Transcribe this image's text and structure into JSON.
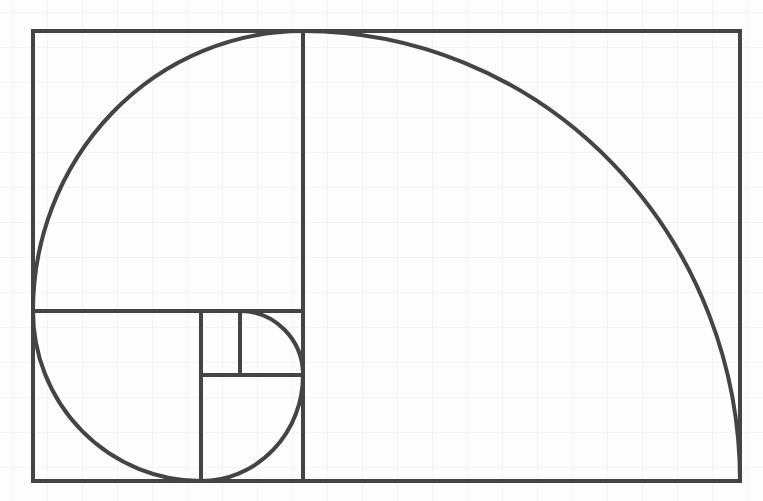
{
  "diagram": {
    "title": "",
    "type": "golden-spiral",
    "stroke_color": "#444444",
    "stroke_width": 4,
    "background_color": "#fdfdfd",
    "grid_spacing": 35,
    "outer_rect": {
      "x1": 33,
      "y1": 31,
      "x2": 740,
      "y2": 481
    },
    "squares": [
      {
        "name": "square-1",
        "x1": 33,
        "y1": 31,
        "x2": 303,
        "y2": 311
      },
      {
        "name": "square-2",
        "x1": 303,
        "y1": 31,
        "x2": 740,
        "y2": 481
      },
      {
        "name": "square-3",
        "x1": 33,
        "y1": 311,
        "x2": 201,
        "y2": 481
      },
      {
        "name": "square-4",
        "x1": 201,
        "y1": 375,
        "x2": 303,
        "y2": 481
      },
      {
        "name": "square-5",
        "x1": 240,
        "y1": 311,
        "x2": 303,
        "y2": 375
      },
      {
        "name": "square-6",
        "x1": 201,
        "y1": 311,
        "x2": 240,
        "y2": 375
      }
    ],
    "lines": [
      {
        "x1": 303,
        "y1": 31,
        "x2": 303,
        "y2": 481
      },
      {
        "x1": 33,
        "y1": 311,
        "x2": 303,
        "y2": 311
      },
      {
        "x1": 201,
        "y1": 311,
        "x2": 201,
        "y2": 481
      },
      {
        "x1": 201,
        "y1": 375,
        "x2": 303,
        "y2": 375
      },
      {
        "x1": 240,
        "y1": 311,
        "x2": 240,
        "y2": 375
      }
    ],
    "spiral_path": "M 740 481 A 437 450 0 0 0 303 31 A 270 280 0 0 0 33 311 A 168 170 0 0 0 201 481 A 102 106 0 0 0 303 375 A 63 64 0 0 0 240 311"
  }
}
